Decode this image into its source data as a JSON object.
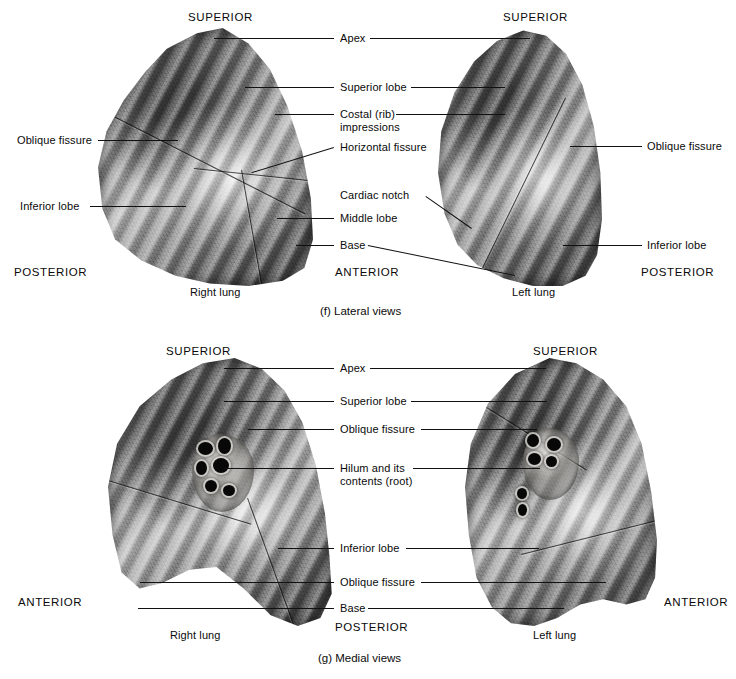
{
  "panels": [
    {
      "id": "lateral",
      "caption": "(f) Lateral views",
      "specimens": [
        {
          "name": "Right lung",
          "side": "right"
        },
        {
          "name": "Left lung",
          "side": "left"
        }
      ],
      "orientation_labels": [
        {
          "text": "SUPERIOR",
          "position": "top-left"
        },
        {
          "text": "SUPERIOR",
          "position": "top-right"
        },
        {
          "text": "POSTERIOR",
          "position": "bottom-left"
        },
        {
          "text": "ANTERIOR",
          "position": "bottom-center"
        },
        {
          "text": "POSTERIOR",
          "position": "bottom-right"
        }
      ],
      "left_labels": [
        {
          "text": "Oblique fissure"
        },
        {
          "text": "Inferior lobe"
        }
      ],
      "center_labels": [
        {
          "text": "Apex"
        },
        {
          "text": "Superior lobe"
        },
        {
          "text": "Costal (rib)"
        },
        {
          "text": "impressions"
        },
        {
          "text": "Horizontal fissure"
        },
        {
          "text": "Cardiac notch"
        },
        {
          "text": "Middle lobe"
        },
        {
          "text": "Base"
        }
      ],
      "right_labels": [
        {
          "text": "Oblique fissure"
        },
        {
          "text": "Inferior lobe"
        }
      ]
    },
    {
      "id": "medial",
      "caption": "(g) Medial views",
      "specimens": [
        {
          "name": "Right lung",
          "side": "right"
        },
        {
          "name": "Left lung",
          "side": "left"
        }
      ],
      "orientation_labels": [
        {
          "text": "SUPERIOR",
          "position": "top-left"
        },
        {
          "text": "SUPERIOR",
          "position": "top-right"
        },
        {
          "text": "ANTERIOR",
          "position": "bottom-left"
        },
        {
          "text": "POSTERIOR",
          "position": "bottom-center"
        },
        {
          "text": "ANTERIOR",
          "position": "bottom-right"
        }
      ],
      "center_labels": [
        {
          "text": "Apex"
        },
        {
          "text": "Superior lobe"
        },
        {
          "text": "Oblique fissure"
        },
        {
          "text": "Hilum and its"
        },
        {
          "text": "contents (root)"
        },
        {
          "text": "Inferior lobe"
        },
        {
          "text": "Oblique fissure"
        },
        {
          "text": "Base"
        }
      ]
    }
  ],
  "lateral": {
    "sup_left": "SUPERIOR",
    "sup_right": "SUPERIOR",
    "post_left": "POSTERIOR",
    "ant_center": "ANTERIOR",
    "post_right": "POSTERIOR",
    "oblique_left": "Oblique fissure",
    "inferior_left": "Inferior lobe",
    "apex": "Apex",
    "superior_lobe": "Superior lobe",
    "costal_line1": "Costal (rib)",
    "costal_line2": "impressions",
    "horizontal_fissure": "Horizontal fissure",
    "cardiac_notch": "Cardiac notch",
    "middle_lobe": "Middle lobe",
    "base": "Base",
    "oblique_right": "Oblique fissure",
    "inferior_right": "Inferior lobe",
    "right_lung": "Right lung",
    "left_lung": "Left lung",
    "caption": "(f) Lateral views"
  },
  "medial": {
    "sup_left": "SUPERIOR",
    "sup_right": "SUPERIOR",
    "ant_left": "ANTERIOR",
    "post_center": "POSTERIOR",
    "ant_right": "ANTERIOR",
    "apex": "Apex",
    "superior_lobe": "Superior lobe",
    "oblique_upper": "Oblique fissure",
    "hilum_line1": "Hilum and its",
    "hilum_line2": "contents (root)",
    "inferior_lobe": "Inferior lobe",
    "oblique_lower": "Oblique fissure",
    "base": "Base",
    "right_lung": "Right lung",
    "left_lung": "Left lung",
    "caption": "(g) Medial views"
  },
  "colors": {
    "background": "#ffffff",
    "text": "#0a0a0a",
    "leader": "#111111"
  }
}
